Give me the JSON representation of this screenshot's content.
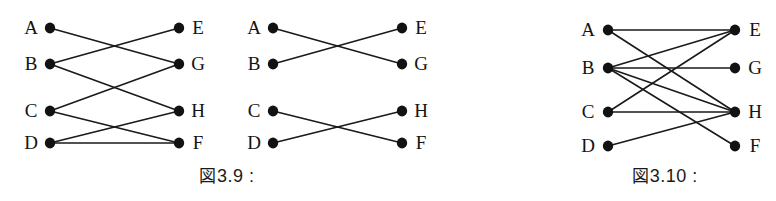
{
  "page": {
    "background_color": "#ffffff",
    "ink_color": "#141414",
    "width": 776,
    "height": 201
  },
  "figures": [
    {
      "id": "figure-3-9",
      "caption": "図3.9 :",
      "caption_cjk": "図",
      "caption_text": "3.9 :",
      "caption_x": 227,
      "caption_y": 162,
      "graphs": [
        {
          "id": "graph-left",
          "left_x": 50,
          "right_x": 179,
          "rows_y": [
            43,
            99,
            156
          ],
          "vertices": [
            {
              "name": "A",
              "side": "left",
              "x": 50,
              "y": 28,
              "label_x": 31,
              "label_y": 27
            },
            {
              "name": "B",
              "side": "left",
              "x": 50,
              "y": 64,
              "label_x": 31,
              "label_y": 63
            },
            {
              "name": "C",
              "side": "left",
              "x": 50,
              "y": 111,
              "label_x": 31,
              "label_y": 110
            },
            {
              "name": "D",
              "side": "left",
              "x": 50,
              "y": 143,
              "label_x": 31,
              "label_y": 142
            },
            {
              "name": "E",
              "side": "right",
              "x": 179,
              "y": 28,
              "label_x": 198,
              "label_y": 27
            },
            {
              "name": "G",
              "side": "right",
              "x": 179,
              "y": 64,
              "label_x": 198,
              "label_y": 63
            },
            {
              "name": "H",
              "side": "right",
              "x": 179,
              "y": 111,
              "label_x": 198,
              "label_y": 110
            },
            {
              "name": "F",
              "side": "right",
              "x": 179,
              "y": 143,
              "label_x": 198,
              "label_y": 142
            }
          ],
          "edges": [
            {
              "from": "A",
              "to": "G"
            },
            {
              "from": "B",
              "to": "E"
            },
            {
              "from": "B",
              "to": "H"
            },
            {
              "from": "C",
              "to": "G"
            },
            {
              "from": "C",
              "to": "F"
            },
            {
              "from": "D",
              "to": "H"
            },
            {
              "from": "D",
              "to": "F"
            }
          ]
        },
        {
          "id": "graph-middle",
          "left_x": 273,
          "right_x": 402,
          "vertices": [
            {
              "name": "A",
              "side": "left",
              "x": 273,
              "y": 28,
              "label_x": 254,
              "label_y": 27
            },
            {
              "name": "B",
              "side": "left",
              "x": 273,
              "y": 64,
              "label_x": 254,
              "label_y": 63
            },
            {
              "name": "C",
              "side": "left",
              "x": 273,
              "y": 111,
              "label_x": 254,
              "label_y": 110
            },
            {
              "name": "D",
              "side": "left",
              "x": 273,
              "y": 143,
              "label_x": 254,
              "label_y": 142
            },
            {
              "name": "E",
              "side": "right",
              "x": 402,
              "y": 28,
              "label_x": 421,
              "label_y": 27
            },
            {
              "name": "G",
              "side": "right",
              "x": 402,
              "y": 64,
              "label_x": 421,
              "label_y": 63
            },
            {
              "name": "H",
              "side": "right",
              "x": 402,
              "y": 111,
              "label_x": 421,
              "label_y": 110
            },
            {
              "name": "F",
              "side": "right",
              "x": 402,
              "y": 143,
              "label_x": 421,
              "label_y": 142
            }
          ],
          "edges": [
            {
              "from": "A",
              "to": "G"
            },
            {
              "from": "B",
              "to": "E"
            },
            {
              "from": "C",
              "to": "F"
            },
            {
              "from": "D",
              "to": "H"
            }
          ]
        }
      ]
    },
    {
      "id": "figure-3-10",
      "caption": "図3.10 :",
      "caption_cjk": "図",
      "caption_text": "3.10 :",
      "caption_x": 665,
      "caption_y": 162,
      "graphs": [
        {
          "id": "graph-right",
          "left_x": 608,
          "right_x": 735,
          "vertices": [
            {
              "name": "A",
              "side": "left",
              "x": 608,
              "y": 30,
              "label_x": 588,
              "label_y": 29
            },
            {
              "name": "B",
              "side": "left",
              "x": 608,
              "y": 68,
              "label_x": 588,
              "label_y": 67
            },
            {
              "name": "C",
              "side": "left",
              "x": 608,
              "y": 112,
              "label_x": 588,
              "label_y": 111
            },
            {
              "name": "D",
              "side": "left",
              "x": 608,
              "y": 146,
              "label_x": 588,
              "label_y": 145
            },
            {
              "name": "E",
              "side": "right",
              "x": 735,
              "y": 30,
              "label_x": 755,
              "label_y": 29
            },
            {
              "name": "G",
              "side": "right",
              "x": 735,
              "y": 68,
              "label_x": 755,
              "label_y": 67
            },
            {
              "name": "H",
              "side": "right",
              "x": 735,
              "y": 112,
              "label_x": 755,
              "label_y": 111
            },
            {
              "name": "F",
              "side": "right",
              "x": 735,
              "y": 146,
              "label_x": 755,
              "label_y": 145
            }
          ],
          "edges": [
            {
              "from": "A",
              "to": "E"
            },
            {
              "from": "A",
              "to": "H"
            },
            {
              "from": "B",
              "to": "E"
            },
            {
              "from": "B",
              "to": "G"
            },
            {
              "from": "B",
              "to": "H"
            },
            {
              "from": "B",
              "to": "F"
            },
            {
              "from": "C",
              "to": "E"
            },
            {
              "from": "C",
              "to": "H"
            },
            {
              "from": "D",
              "to": "H"
            }
          ]
        }
      ]
    }
  ],
  "style": {
    "vertex_radius": 5.2,
    "edge_width": 1.6,
    "edge_color": "#1a1a1a",
    "vertex_color": "#121212",
    "label_font_size": 19,
    "caption_font_size": 18
  }
}
